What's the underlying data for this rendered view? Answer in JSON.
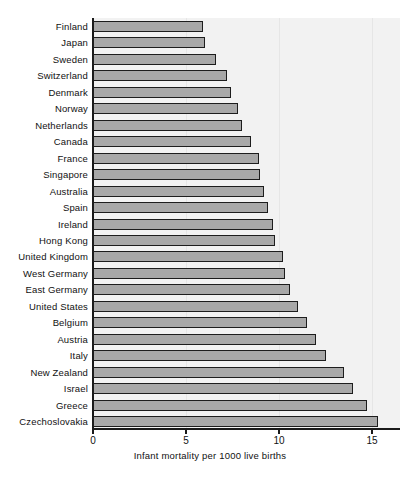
{
  "chart_data": {
    "type": "bar",
    "orientation": "horizontal",
    "title": "",
    "xlabel": "Infant mortality per 1000 live births",
    "ylabel": "",
    "xlim": [
      0,
      16.5
    ],
    "xticks": [
      0,
      5,
      10,
      15
    ],
    "xtick_labels": [
      "0",
      "5",
      "10",
      "15"
    ],
    "grid": true,
    "grid_axis": "x",
    "legend": null,
    "categories": [
      "Finland",
      "Japan",
      "Sweden",
      "Switzerland",
      "Denmark",
      "Norway",
      "Netherlands",
      "Canada",
      "France",
      "Singapore",
      "Australia",
      "Spain",
      "Ireland",
      "Hong Kong",
      "United Kingdom",
      "West Germany",
      "East Germany",
      "United States",
      "Belgium",
      "Austria",
      "Italy",
      "New Zealand",
      "Israel",
      "Greece",
      "Czechoslovakia"
    ],
    "values": [
      5.9,
      6.0,
      6.6,
      7.2,
      7.4,
      7.8,
      8.0,
      8.5,
      8.9,
      9.0,
      9.2,
      9.4,
      9.7,
      9.8,
      10.2,
      10.3,
      10.6,
      11.0,
      11.5,
      12.0,
      12.5,
      13.5,
      14.0,
      14.7,
      15.3
    ],
    "bar_fill_color": "#a8a8a8",
    "bar_edge_color": "#1d1d1d",
    "plot_background_color": "#f2f2f2",
    "figure_background_color": "#ffffff"
  }
}
